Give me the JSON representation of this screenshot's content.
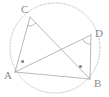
{
  "figure": {
    "background_color": "#ffffff",
    "stroke_color": "#9a9a9a",
    "circle_color": "#b9b9b9",
    "label_color": "#8a8a8a",
    "mark_color": "#7d7d7d",
    "circle": {
      "name": "circumscribed-circle",
      "center_x": 55,
      "center_y": 48,
      "radius": 45,
      "style": "dotted"
    },
    "vertices": [
      {
        "id": "C",
        "label": "C",
        "x": 30,
        "y": 17,
        "label_x": 21,
        "label_y": 13
      },
      {
        "id": "D",
        "label": "D",
        "x": 91,
        "y": 35,
        "label_x": 95,
        "label_y": 37
      },
      {
        "id": "A",
        "label": "A",
        "x": 15,
        "y": 72,
        "label_x": 4,
        "label_y": 79
      },
      {
        "id": "B",
        "label": "B",
        "x": 90,
        "y": 79,
        "label_x": 94,
        "label_y": 87
      }
    ],
    "segments": [
      {
        "name": "segment-CA",
        "from": "C",
        "to": "A"
      },
      {
        "name": "segment-CB",
        "from": "C",
        "to": "B"
      },
      {
        "name": "segment-AD",
        "from": "A",
        "to": "D"
      },
      {
        "name": "segment-DB",
        "from": "D",
        "to": "B"
      },
      {
        "name": "segment-AB",
        "from": "A",
        "to": "B"
      }
    ],
    "angle_marks": [
      {
        "name": "right-angle-arc-at-C",
        "type": "arc",
        "at": "C"
      },
      {
        "name": "right-angle-arc-at-D",
        "type": "arc",
        "at": "D"
      },
      {
        "name": "right-angle-square-at-A",
        "type": "square",
        "at": "A",
        "x": 22,
        "y": 61
      },
      {
        "name": "right-angle-square-at-B",
        "type": "square",
        "at": "B",
        "x": 80,
        "y": 66
      }
    ],
    "notes": {
      "angle_acb": "90",
      "angle_adb": "90"
    }
  }
}
